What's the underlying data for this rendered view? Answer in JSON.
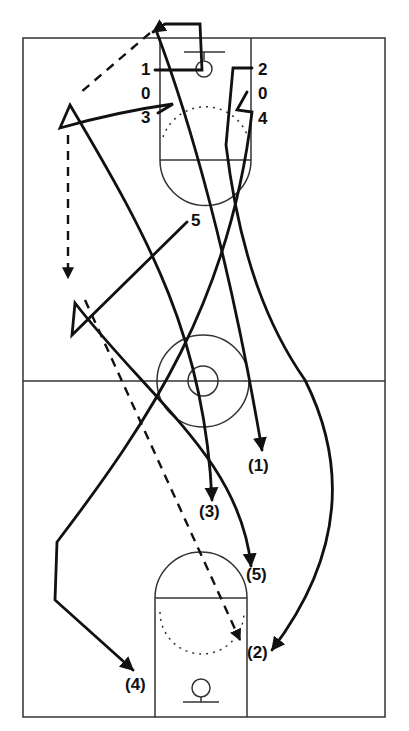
{
  "diagram": {
    "type": "basketball-play",
    "colors": {
      "ink": "#111111",
      "court_line": "#333333",
      "background": "#ffffff"
    },
    "start_labels": [
      {
        "id": "p1",
        "text": "1",
        "x": 141,
        "y": 75
      },
      {
        "id": "o1",
        "text": "0",
        "x": 141,
        "y": 99
      },
      {
        "id": "p3",
        "text": "3",
        "x": 141,
        "y": 123
      },
      {
        "id": "p2",
        "text": "2",
        "x": 258,
        "y": 75
      },
      {
        "id": "o2",
        "text": "0",
        "x": 258,
        "y": 99
      },
      {
        "id": "p4",
        "text": "4",
        "x": 258,
        "y": 124
      },
      {
        "id": "p5",
        "text": "5",
        "x": 191,
        "y": 226
      }
    ],
    "end_labels": [
      {
        "id": "e1",
        "text": "(1)",
        "x": 248,
        "y": 471
      },
      {
        "id": "e3",
        "text": "(3)",
        "x": 199,
        "y": 517
      },
      {
        "id": "e5",
        "text": "(5)",
        "x": 246,
        "y": 580
      },
      {
        "id": "e2",
        "text": "(2)",
        "x": 247,
        "y": 658
      },
      {
        "id": "e4",
        "text": "(4)",
        "x": 125,
        "y": 690
      }
    ]
  }
}
